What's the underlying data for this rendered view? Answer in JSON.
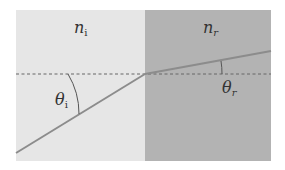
{
  "diagram": {
    "type": "refraction",
    "colors": {
      "medium_i": "#e6e6e6",
      "medium_r": "#b3b3b3",
      "ray": "#8c8c8c",
      "normal": "#666666",
      "arc": "#555555",
      "background": "#ffffff"
    },
    "labels": {
      "n_i": {
        "base": "n",
        "sub": "i"
      },
      "n_r": {
        "base": "n",
        "sub": "r"
      },
      "theta_i": {
        "base": "θ",
        "sub": "i"
      },
      "theta_r": {
        "base": "θ",
        "sub": "r"
      }
    },
    "geometry": {
      "left": 16,
      "top": 10,
      "right": 271,
      "bottom": 161,
      "interface_x": 145,
      "normal_y": 74,
      "incident_start": [
        16,
        153
      ],
      "refracted_end": [
        271,
        51
      ]
    }
  }
}
